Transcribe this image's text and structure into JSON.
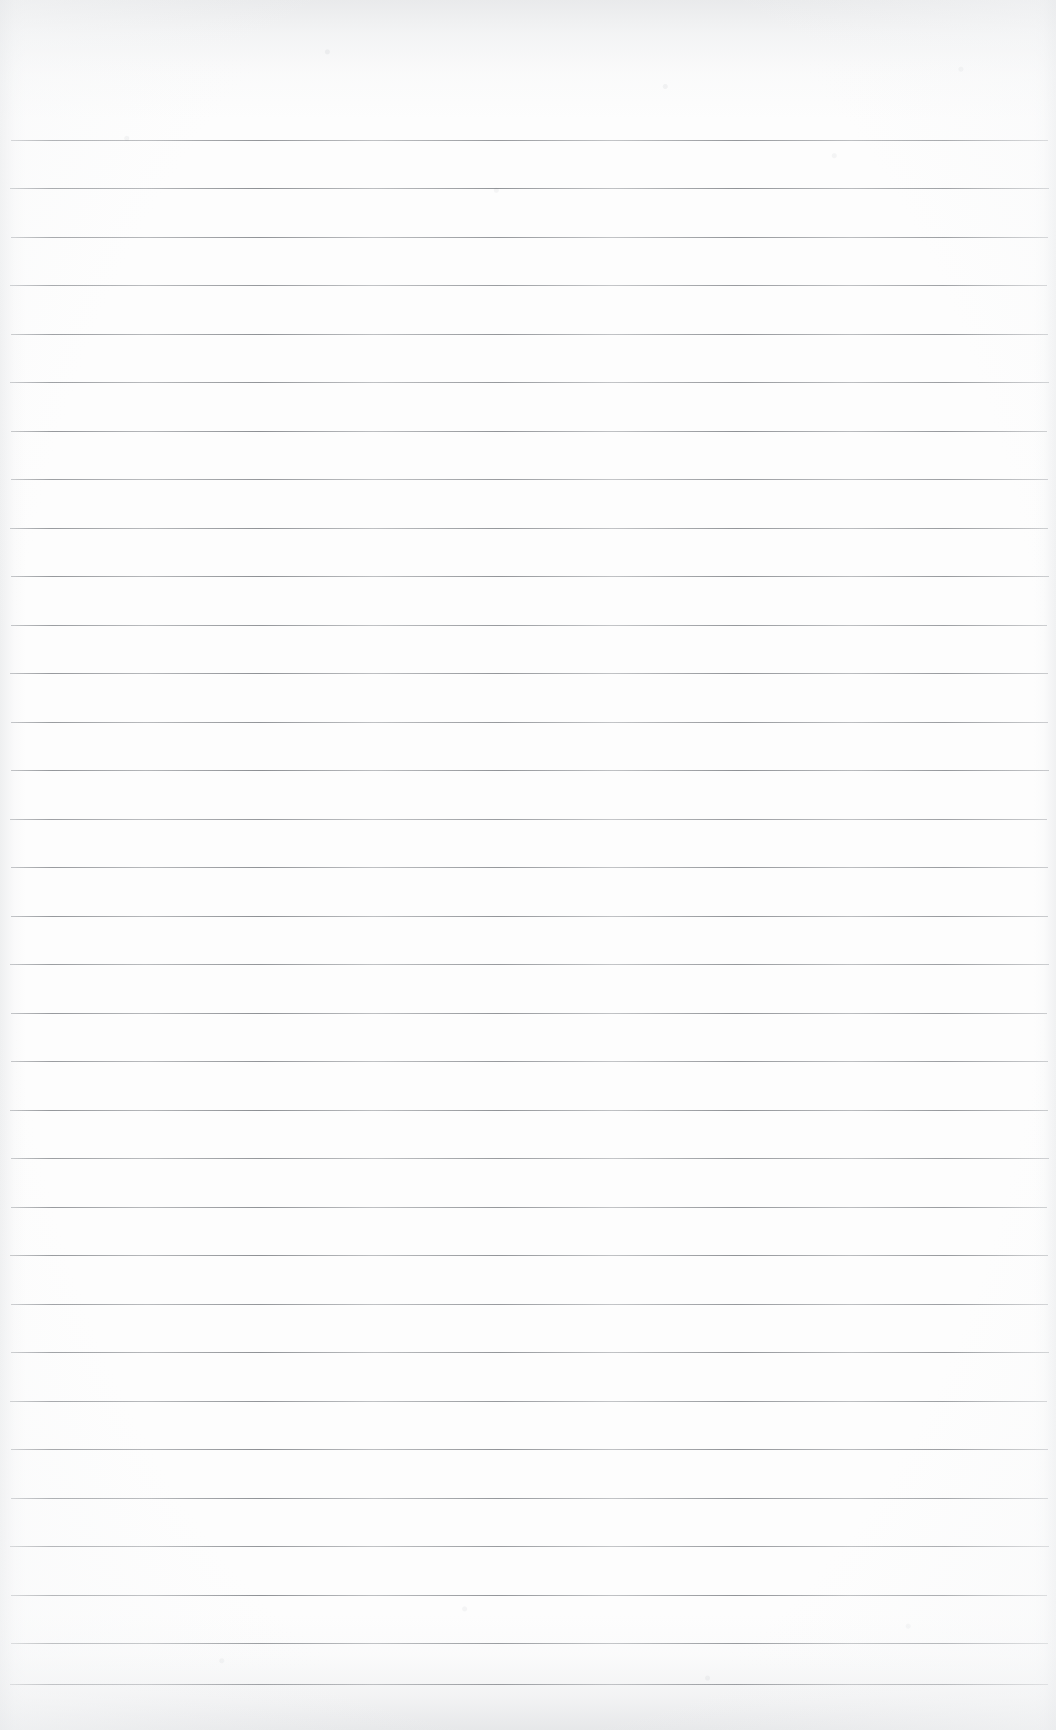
{
  "document": {
    "kind": "scanned-blank-ruled-paper",
    "content_text": "",
    "width_px": 1056,
    "height_px": 1730
  },
  "paper": {
    "background_color": "#fdfdfd",
    "edge_shadow_color": "#b0b4ba"
  },
  "ruling": {
    "line_color": "#5f636a",
    "line_thickness_px": 1,
    "line_spacing_px": 48.5,
    "first_line_y_px": 140,
    "line_left_x_px": 11,
    "line_right_x_px": 1048,
    "line_count": 33,
    "lines": [
      {
        "index": 1,
        "y": 140,
        "left": 11,
        "right": 1048,
        "opacity": 0.78
      },
      {
        "index": 2,
        "y": 188,
        "left": 10,
        "right": 1049,
        "opacity": 0.82
      },
      {
        "index": 3,
        "y": 237,
        "left": 11,
        "right": 1048,
        "opacity": 0.8
      },
      {
        "index": 4,
        "y": 285,
        "left": 10,
        "right": 1047,
        "opacity": 0.76
      },
      {
        "index": 5,
        "y": 334,
        "left": 11,
        "right": 1048,
        "opacity": 0.81
      },
      {
        "index": 6,
        "y": 382,
        "left": 10,
        "right": 1049,
        "opacity": 0.79
      },
      {
        "index": 7,
        "y": 431,
        "left": 11,
        "right": 1047,
        "opacity": 0.83
      },
      {
        "index": 8,
        "y": 479,
        "left": 11,
        "right": 1048,
        "opacity": 0.77
      },
      {
        "index": 9,
        "y": 528,
        "left": 10,
        "right": 1048,
        "opacity": 0.8
      },
      {
        "index": 10,
        "y": 576,
        "left": 11,
        "right": 1049,
        "opacity": 0.82
      },
      {
        "index": 11,
        "y": 625,
        "left": 11,
        "right": 1047,
        "opacity": 0.78
      },
      {
        "index": 12,
        "y": 673,
        "left": 10,
        "right": 1048,
        "opacity": 0.81
      },
      {
        "index": 13,
        "y": 722,
        "left": 11,
        "right": 1048,
        "opacity": 0.79
      },
      {
        "index": 14,
        "y": 770,
        "left": 11,
        "right": 1049,
        "opacity": 0.83
      },
      {
        "index": 15,
        "y": 819,
        "left": 10,
        "right": 1047,
        "opacity": 0.76
      },
      {
        "index": 16,
        "y": 867,
        "left": 11,
        "right": 1048,
        "opacity": 0.8
      },
      {
        "index": 17,
        "y": 916,
        "left": 11,
        "right": 1048,
        "opacity": 0.82
      },
      {
        "index": 18,
        "y": 964,
        "left": 10,
        "right": 1049,
        "opacity": 0.78
      },
      {
        "index": 19,
        "y": 1013,
        "left": 11,
        "right": 1047,
        "opacity": 0.81
      },
      {
        "index": 20,
        "y": 1061,
        "left": 11,
        "right": 1048,
        "opacity": 0.79
      },
      {
        "index": 21,
        "y": 1110,
        "left": 10,
        "right": 1048,
        "opacity": 0.83
      },
      {
        "index": 22,
        "y": 1158,
        "left": 11,
        "right": 1049,
        "opacity": 0.77
      },
      {
        "index": 23,
        "y": 1207,
        "left": 11,
        "right": 1047,
        "opacity": 0.8
      },
      {
        "index": 24,
        "y": 1255,
        "left": 10,
        "right": 1048,
        "opacity": 0.82
      },
      {
        "index": 25,
        "y": 1304,
        "left": 11,
        "right": 1048,
        "opacity": 0.78
      },
      {
        "index": 26,
        "y": 1352,
        "left": 11,
        "right": 1049,
        "opacity": 0.81
      },
      {
        "index": 27,
        "y": 1401,
        "left": 10,
        "right": 1047,
        "opacity": 0.79
      },
      {
        "index": 28,
        "y": 1449,
        "left": 11,
        "right": 1048,
        "opacity": 0.83
      },
      {
        "index": 29,
        "y": 1498,
        "left": 11,
        "right": 1048,
        "opacity": 0.8
      },
      {
        "index": 30,
        "y": 1546,
        "left": 10,
        "right": 1049,
        "opacity": 0.77
      },
      {
        "index": 31,
        "y": 1595,
        "left": 11,
        "right": 1047,
        "opacity": 0.82
      },
      {
        "index": 32,
        "y": 1643,
        "left": 11,
        "right": 1048,
        "opacity": 0.79
      },
      {
        "index": 33,
        "y": 1684,
        "left": 10,
        "right": 1048,
        "opacity": 0.84
      }
    ]
  }
}
